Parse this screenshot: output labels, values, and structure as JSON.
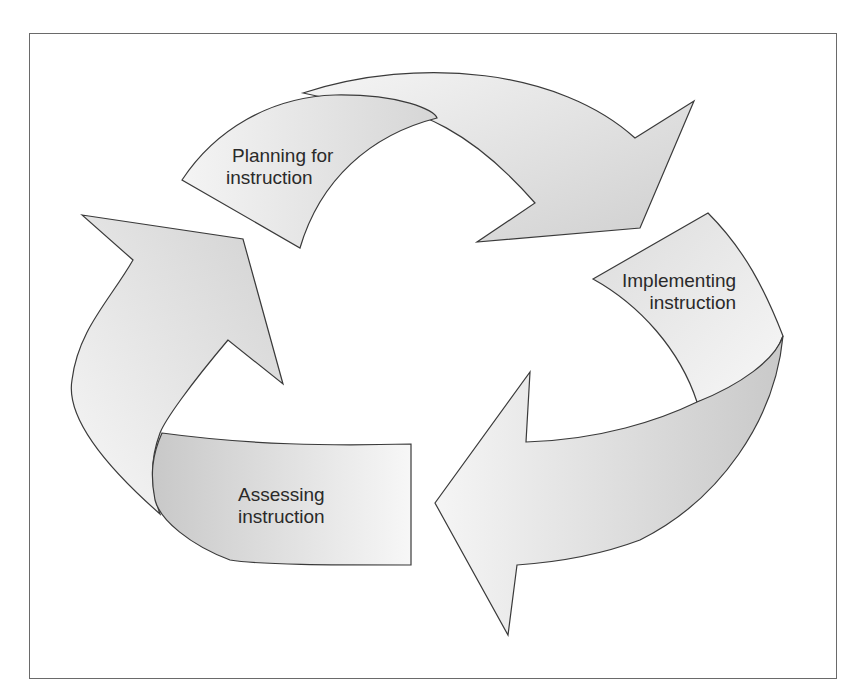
{
  "diagram": {
    "type": "cycle",
    "title": "",
    "stages": [
      {
        "id": "planning",
        "label_line1": "Planning for",
        "label_line2": "instruction"
      },
      {
        "id": "implementing",
        "label_line1": "Implementing",
        "label_line2": "instruction"
      },
      {
        "id": "assessing",
        "label_line1": "Assessing",
        "label_line2": "instruction"
      }
    ],
    "flow": [
      "planning",
      "implementing",
      "assessing",
      "planning"
    ],
    "colors": {
      "arrow_light": "#f2f2f2",
      "arrow_mid": "#dedede",
      "arrow_dark": "#cdcdcd",
      "outline": "#3a3a3a",
      "frame": "#6a6a6a"
    }
  }
}
